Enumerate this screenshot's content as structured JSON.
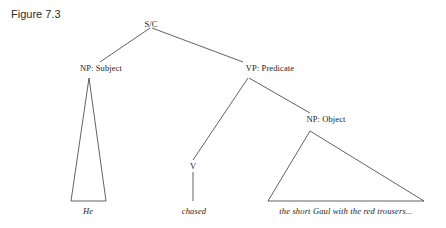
{
  "figure": {
    "label": "Figure 7.3"
  },
  "diagram": {
    "type": "syntax-tree",
    "line_color": "#3a3a3a",
    "text_color": "#1c1c1c",
    "background": "#ffffff",
    "nodes": [
      {
        "id": "root",
        "label": "S/C",
        "x": 151,
        "y": 24
      },
      {
        "id": "subject",
        "label": "NP: Subject",
        "x": 101,
        "y": 68
      },
      {
        "id": "vp",
        "label": "VP: Predicate",
        "x": 270,
        "y": 68
      },
      {
        "id": "v",
        "label": "V",
        "x": 193,
        "y": 166
      },
      {
        "id": "object",
        "label": "NP: Object",
        "x": 326,
        "y": 119
      }
    ],
    "terminals": [
      {
        "id": "subject-terminal",
        "label": "He",
        "x": 88,
        "y": 212
      },
      {
        "id": "verb-terminal",
        "label": "chased",
        "x": 194,
        "y": 212
      },
      {
        "id": "object-terminal",
        "label": "the short Gaul with the red trousers...",
        "x": 346,
        "y": 212
      }
    ],
    "edges": [
      {
        "id": "root-to-subject",
        "from": "root",
        "to": "subject",
        "x1": 150,
        "y1": 28,
        "x2": 100,
        "y2": 62
      },
      {
        "id": "root-to-vp",
        "from": "root",
        "to": "vp",
        "x1": 152,
        "y1": 28,
        "x2": 243,
        "y2": 62
      },
      {
        "id": "vp-to-v",
        "from": "vp",
        "to": "v",
        "x1": 248,
        "y1": 78,
        "x2": 193,
        "y2": 160
      },
      {
        "id": "vp-to-object",
        "from": "vp",
        "to": "object",
        "x1": 249,
        "y1": 78,
        "x2": 310,
        "y2": 113
      },
      {
        "id": "v-to-terminal",
        "from": "v",
        "to": "verb-terminal",
        "x1": 193,
        "y1": 172,
        "x2": 193,
        "y2": 201
      }
    ],
    "triangles": [
      {
        "id": "subject-triangle",
        "apex_x": 89,
        "apex_y": 78,
        "left_x": 71,
        "right_x": 106,
        "base_y": 201
      },
      {
        "id": "object-triangle",
        "apex_x": 310,
        "apex_y": 131,
        "left_x": 268,
        "right_x": 424,
        "base_y": 201
      }
    ]
  }
}
